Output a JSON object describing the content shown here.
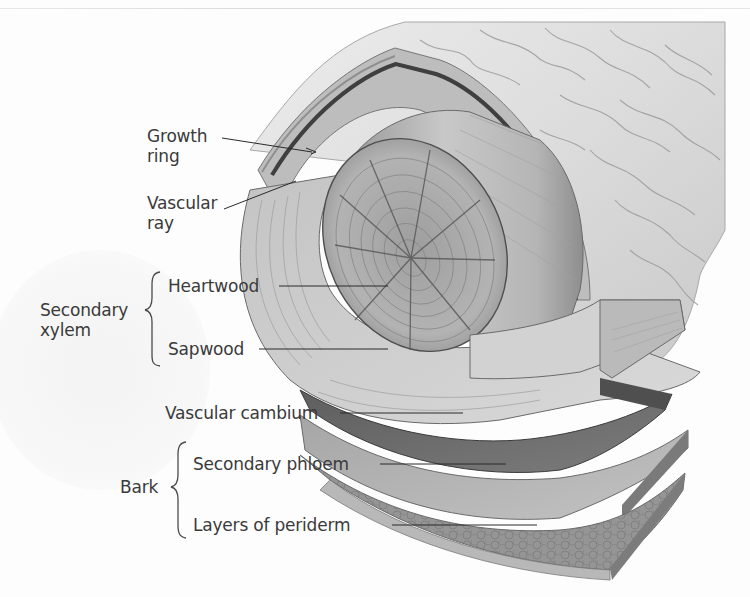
{
  "figure": {
    "labels": {
      "growth_ring": "Growth ring",
      "growth_ring_line1": "Growth",
      "growth_ring_line2": "ring",
      "vascular_ray_line1": "Vascular",
      "vascular_ray_line2": "ray",
      "heartwood": "Heartwood",
      "sapwood": "Sapwood",
      "secondary_xylem_line1": "Secondary",
      "secondary_xylem_line2": "xylem",
      "vascular_cambium": "Vascular cambium",
      "secondary_phloem": "Secondary phloem",
      "layers_of_periderm": "Layers of periderm",
      "bark": "Bark"
    },
    "groups": [
      {
        "name": "Secondary xylem",
        "members": [
          "Heartwood",
          "Sapwood"
        ]
      },
      {
        "name": "Bark",
        "members": [
          "Secondary phloem",
          "Layers of periderm"
        ]
      }
    ],
    "colors": {
      "label_text": "#3a3a3a",
      "leader_line": "#2a2a2a",
      "bark_surface": "#d8d8d8",
      "wood_light": "#cfcfcf",
      "wood_mid": "#a9a9a9",
      "cambium": "#6e6e6e",
      "phloem": "#b4b4b4",
      "periderm": "#8f8f8f"
    }
  }
}
